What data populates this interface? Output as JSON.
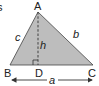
{
  "diagram": {
    "type": "triangle-altitude",
    "vertices": {
      "A": {
        "label": "A",
        "x": 38,
        "y": 12
      },
      "B": {
        "label": "B",
        "x": 10,
        "y": 65
      },
      "C": {
        "label": "C",
        "x": 93,
        "y": 65
      },
      "D": {
        "label": "D",
        "x": 38,
        "y": 65
      }
    },
    "sides": {
      "a": {
        "label": "a"
      },
      "b": {
        "label": "b"
      },
      "c": {
        "label": "c"
      },
      "h": {
        "label": "h"
      }
    },
    "edge_label": "s",
    "colors": {
      "fill": "#bdbdbd",
      "stroke": "#333333",
      "text": "#222222"
    }
  }
}
